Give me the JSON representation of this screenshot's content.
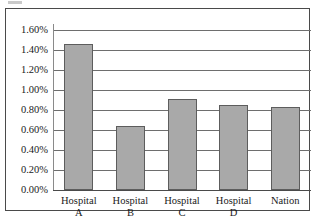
{
  "chart_data": {
    "type": "bar",
    "title": "",
    "xlabel": "",
    "ylabel": "",
    "categories": [
      "Hospital A",
      "Hospital B",
      "Hospital C",
      "Hospital D",
      "Nation"
    ],
    "category_lines": [
      [
        "Hospital",
        "A"
      ],
      [
        "Hospital",
        "B"
      ],
      [
        "Hospital",
        "C"
      ],
      [
        "Hospital",
        "D"
      ],
      [
        "Nation",
        ""
      ]
    ],
    "values": [
      1.46,
      0.64,
      0.91,
      0.85,
      0.83
    ],
    "value_labels": [
      "1.46%",
      "0.64%",
      "0.91%",
      "0.85%",
      "0.83%"
    ],
    "ylim": [
      0.0,
      1.6
    ],
    "ytick_values": [
      1.6,
      1.4,
      1.2,
      1.0,
      0.8,
      0.6,
      0.4,
      0.2,
      0.0
    ],
    "ytick_labels": [
      "1.60%",
      "1.40%",
      "1.20%",
      "1.00%",
      "0.80%",
      "0.60%",
      "0.40%",
      "0.20%",
      "0.00%"
    ],
    "grid": true,
    "legend": false,
    "legend_position": "none",
    "bar_color": "#a9a9a9",
    "bar_border_color": "#5d5d5d",
    "gridline_color": "#6e6e6e",
    "frame_color": "#4a4a4a",
    "text_color": "#1a1a1a"
  }
}
